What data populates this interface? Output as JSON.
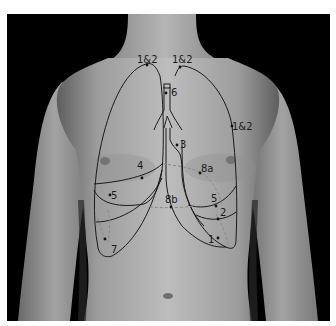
{
  "figure": {
    "colors": {
      "background": "#000000",
      "skin_light": "#b9b9b9",
      "skin_mid": "#9a9a9a",
      "skin_dark": "#6e6e6e",
      "outline": "#1a1a1a",
      "dashed": "#8a8a8a",
      "border": "#ffffff"
    },
    "labels": {
      "apex_left": "1&2",
      "apex_right": "1&2",
      "lateral_right": "1&2",
      "trachea": "6",
      "bronchus": "3",
      "fissure_left": "4",
      "point_8a": "8a",
      "base_left_5": "5",
      "point_8b": "8b",
      "base_right_5": "5",
      "base_right_2": "2",
      "base_right_1": "1",
      "costophrenic_left": "7"
    }
  }
}
